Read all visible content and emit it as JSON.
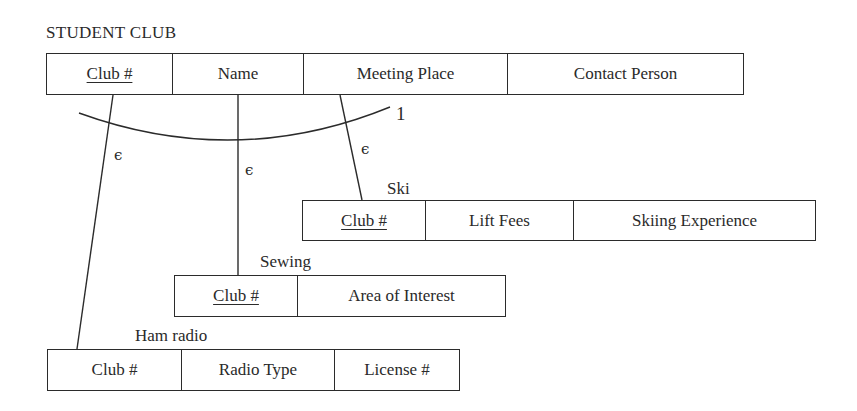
{
  "diagram": {
    "title": "STUDENT CLUB",
    "supertype": {
      "name": "STUDENT CLUB",
      "attributes": [
        {
          "label": "Club #",
          "key": true
        },
        {
          "label": "Name",
          "key": false
        },
        {
          "label": "Meeting Place",
          "key": false
        },
        {
          "label": "Contact Person",
          "key": false
        }
      ]
    },
    "subtypes": [
      {
        "name": "Ski",
        "attributes": [
          {
            "label": "Club #",
            "key": true
          },
          {
            "label": "Lift Fees",
            "key": false
          },
          {
            "label": "Skiing Experience",
            "key": false
          }
        ]
      },
      {
        "name": "Sewing",
        "attributes": [
          {
            "label": "Club #",
            "key": true
          },
          {
            "label": "Area of Interest",
            "key": false
          }
        ]
      },
      {
        "name": "Ham radio",
        "attributes": [
          {
            "label": "Club #",
            "key": false
          },
          {
            "label": "Radio Type",
            "key": false
          },
          {
            "label": "License #",
            "key": false
          }
        ]
      }
    ],
    "relationship": {
      "cardinality": "1",
      "membership_symbol": "ϵ",
      "membership_symbols": [
        "ϵ",
        "ϵ",
        "ϵ"
      ]
    }
  }
}
